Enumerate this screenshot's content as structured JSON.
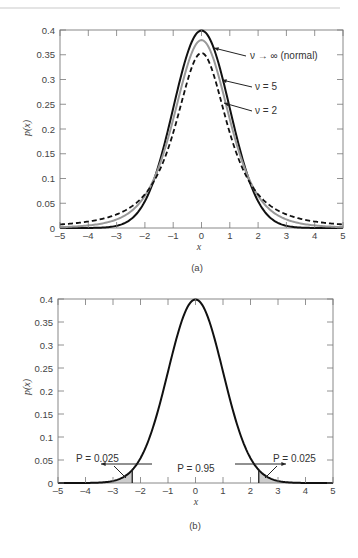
{
  "chart_data": [
    {
      "id": "a",
      "type": "line",
      "caption": "(a)",
      "xlabel": "x",
      "ylabel": "p(x)",
      "xlim": [
        -5,
        5
      ],
      "ylim": [
        0,
        0.4
      ],
      "xticks": [
        -5,
        -4,
        -3,
        -2,
        -1,
        0,
        1,
        2,
        3,
        4,
        5
      ],
      "yticks": [
        0,
        0.05,
        0.1,
        0.15,
        0.2,
        0.25,
        0.3,
        0.35,
        0.4
      ],
      "ytick_labels": [
        "0",
        "0.05",
        "0.1",
        "0.15",
        "0.2",
        "0.25",
        "0.3",
        "0.35",
        "0.4"
      ],
      "grid": false,
      "series": [
        {
          "name": "ν → ∞ (normal)",
          "style": "solid",
          "color": "#111111",
          "dist": "normal",
          "peak": 0.399
        },
        {
          "name": "ν = 5",
          "style": "solid",
          "color": "#999999",
          "dist": "t",
          "dof": 5,
          "peak": 0.38
        },
        {
          "name": "ν = 2",
          "style": "dashed",
          "color": "#111111",
          "dist": "t",
          "dof": 2,
          "peak": 0.354
        }
      ],
      "annotations": [
        {
          "text": "ν → ∞ (normal)",
          "series": 0
        },
        {
          "text": "ν = 5",
          "series": 1
        },
        {
          "text": "ν = 2",
          "series": 2
        }
      ]
    },
    {
      "id": "b",
      "type": "line",
      "caption": "(b)",
      "xlabel": "x",
      "ylabel": "p(x)",
      "xlim": [
        -5,
        5
      ],
      "ylim": [
        0,
        0.4
      ],
      "xticks": [
        -5,
        -4,
        -3,
        -2,
        -1,
        0,
        1,
        2,
        3,
        4,
        5
      ],
      "yticks": [
        0,
        0.05,
        0.1,
        0.15,
        0.2,
        0.25,
        0.3,
        0.35,
        0.4
      ],
      "ytick_labels": [
        "0",
        "0.05",
        "0.1",
        "0.15",
        "0.2",
        "0.25",
        "0.3",
        "0.35",
        "0.4"
      ],
      "grid": false,
      "series": [
        {
          "name": "normal",
          "style": "solid",
          "color": "#111111",
          "dist": "normal",
          "peak": 0.399
        }
      ],
      "shaded_regions": [
        {
          "from": -5,
          "to": -2.3,
          "fill": "#cccccc"
        },
        {
          "from": 2.3,
          "to": 5,
          "fill": "#cccccc"
        }
      ],
      "critical_values": [
        -2.3,
        2.3
      ],
      "annotations": [
        {
          "text": "P = 0.025",
          "position": "left-tail"
        },
        {
          "text": "P = 0.95",
          "position": "center"
        },
        {
          "text": "P = 0.025",
          "position": "right-tail"
        }
      ]
    }
  ],
  "labels": {
    "a_caption": "(a)",
    "b_caption": "(b)",
    "a_xlabel": "x",
    "b_xlabel": "x",
    "a_ylabel": "p(x)",
    "b_ylabel": "p(x)",
    "a_ann_normal": "ν → ∞ (normal)",
    "a_ann_nu5": "ν = 5",
    "a_ann_nu2": "ν = 2",
    "b_ann_left": "P = 0.025",
    "b_ann_center": "P = 0.95",
    "b_ann_right": "P = 0.025"
  }
}
